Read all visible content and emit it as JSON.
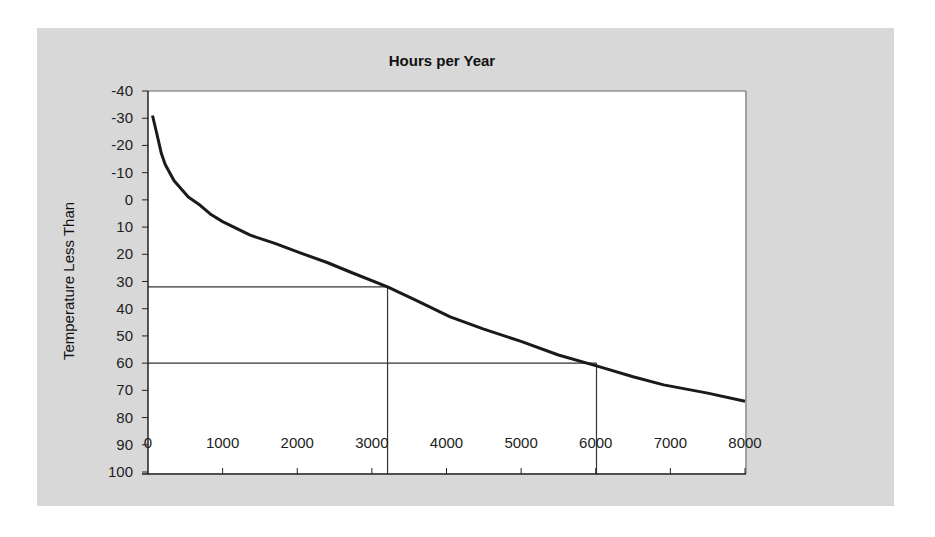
{
  "chart_data": {
    "type": "line",
    "title": "Hours per Year",
    "xlabel": "",
    "ylabel": "Temperature Less Than",
    "xlim": [
      0,
      8000
    ],
    "ylim": [
      -40,
      100
    ],
    "y_inverted": true,
    "x_ticks": [
      0,
      1000,
      2000,
      3000,
      4000,
      5000,
      6000,
      7000,
      8000
    ],
    "y_ticks": [
      -40,
      -30,
      -20,
      -10,
      0,
      10,
      20,
      30,
      40,
      50,
      60,
      70,
      80,
      90,
      100
    ],
    "grid": false,
    "legend": null,
    "series": [
      {
        "name": "Temperature Less Than",
        "x": [
          60,
          120,
          180,
          230,
          350,
          540,
          700,
          850,
          1000,
          1370,
          1700,
          2040,
          2400,
          2710,
          3210,
          3600,
          4050,
          4500,
          5000,
          5500,
          6010,
          6500,
          6910,
          7500,
          8000
        ],
        "y": [
          -31,
          -24,
          -17,
          -13,
          -7,
          -1,
          2,
          5.5,
          8,
          13,
          16,
          19.5,
          23,
          26.5,
          32,
          37,
          43,
          47.5,
          52,
          57,
          61,
          65,
          68,
          71,
          74
        ]
      }
    ],
    "reference_lines": [
      {
        "type": "horizontal",
        "y": 32,
        "x_to": 3210
      },
      {
        "type": "vertical",
        "x": 3210,
        "y_from": 32,
        "y_to": 100
      },
      {
        "type": "horizontal",
        "y": 60,
        "x_to": 6010
      },
      {
        "type": "vertical",
        "x": 6010,
        "y_from": 60,
        "y_to": 100
      }
    ]
  },
  "labels": {
    "title": "Hours per Year",
    "ylabel": "Temperature Less Than",
    "y_ticks": [
      "-40",
      "-30",
      "-20",
      "-10",
      "0",
      "10",
      "20",
      "30",
      "40",
      "50",
      "60",
      "70",
      "80",
      "90",
      "100"
    ],
    "x_ticks": [
      "0",
      "1000",
      "2000",
      "3000",
      "4000",
      "5000",
      "6000",
      "7000",
      "8000"
    ]
  },
  "colors": {
    "background_panel": "#d8d8d8",
    "plot_area": "#ffffff",
    "line": "#1a1a1a",
    "axis": "#333333"
  }
}
